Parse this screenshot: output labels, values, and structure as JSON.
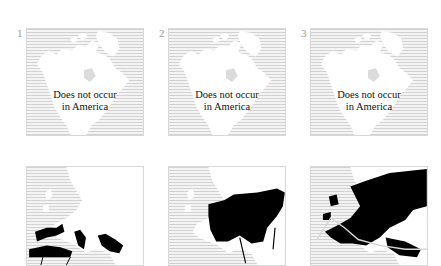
{
  "top_row": {
    "panels": [
      {
        "number": "1",
        "region": "North America",
        "note_line1": "Does not occur",
        "note_line2": "in America"
      },
      {
        "number": "2",
        "region": "North America",
        "note_line1": "Does not occur",
        "note_line2": "in America"
      },
      {
        "number": "3",
        "region": "North America",
        "note_line1": "Does not occur",
        "note_line2": "in America"
      }
    ]
  },
  "bottom_row": {
    "panels": [
      {
        "region": "Europe",
        "distribution": "Mediterranean coasts and North Africa"
      },
      {
        "region": "Europe",
        "distribution": "Central and Eastern Europe"
      },
      {
        "region": "Europe",
        "distribution": "Most of Europe and Northern Asia"
      }
    ]
  },
  "colors": {
    "land": "#ffffff",
    "ocean_stripe": "#d2d2d2",
    "distribution": "#000000",
    "number_text": "#9a9a9a"
  }
}
